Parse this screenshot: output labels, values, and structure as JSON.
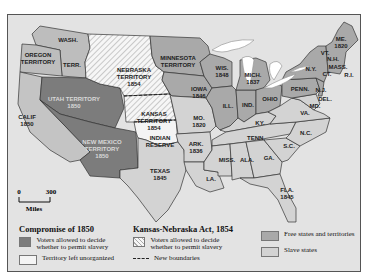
{
  "colors": {
    "background": "#e3e3e3",
    "free_states": "#a9a9a9",
    "slave_states": "#d3d3d3",
    "compromise_territories": "#7c7c7c",
    "unorganized": "#f4f4f4",
    "kansas_nebraska_hatch": "#ffffff",
    "lakes": "#ffffff"
  },
  "regions": {
    "wash": "WASH.",
    "wash_terr": "TERR.",
    "oregon": [
      "OREGON",
      "TERRITORY"
    ],
    "calif": [
      "CALIF",
      "1850"
    ],
    "utah": [
      "UTAH TERRITORY",
      "1850"
    ],
    "new_mexico": [
      "NEW MEXICO",
      "TERRITORY",
      "1850"
    ],
    "nebraska": [
      "NEBRASKA",
      "TERRITORY",
      "1854"
    ],
    "kansas": [
      "KANSAS",
      "TERRITORY",
      "1854"
    ],
    "indian": [
      "INDIAN",
      "RESERVE"
    ],
    "minnesota": [
      "MINNESOTA",
      "TERRITORY"
    ],
    "texas": [
      "TEXAS",
      "1845"
    ],
    "iowa": [
      "IOWA",
      "1846"
    ],
    "wis": [
      "WIS.",
      "1848"
    ],
    "mich": [
      "MICH.",
      "1837"
    ],
    "mo": [
      "MO.",
      "1820"
    ],
    "ark": [
      "ARK.",
      "1836"
    ],
    "ill": "ILL.",
    "ind": "IND.",
    "ohio": "OHIO",
    "ky": "KY.",
    "tenn": "TENN.",
    "la": "LA.",
    "miss": "MISS.",
    "ala": "ALA.",
    "ga": "GA.",
    "sc": "S.C.",
    "nc": "N.C.",
    "va": "VA.",
    "fla": [
      "FLA.",
      "1845"
    ],
    "penn": "PENN.",
    "ny": "N.Y.",
    "nj": "N.J.",
    "del": "DEL.",
    "md": "MD.",
    "vt": "VT.",
    "nh": "N.H.",
    "mass": "MASS.",
    "ct": "CT.",
    "ri": "R.I.",
    "me": [
      "ME.",
      "1820"
    ]
  },
  "scale": {
    "zero": "0",
    "max": "300",
    "unit": "Miles"
  },
  "legend": {
    "compromise": {
      "title": "Compromise of 1850",
      "voters": "Voters allowed to decide whether to permit slavery",
      "unorganized": "Territory left unorganized"
    },
    "kansas_nebraska": {
      "title": "Kansas-Nebraska Act, 1854",
      "voters": "Voters allowed to decide whether to permit slavery",
      "boundaries": "New boundaries"
    },
    "status": {
      "free": "Free states and territories",
      "slave": "Slave states"
    }
  }
}
